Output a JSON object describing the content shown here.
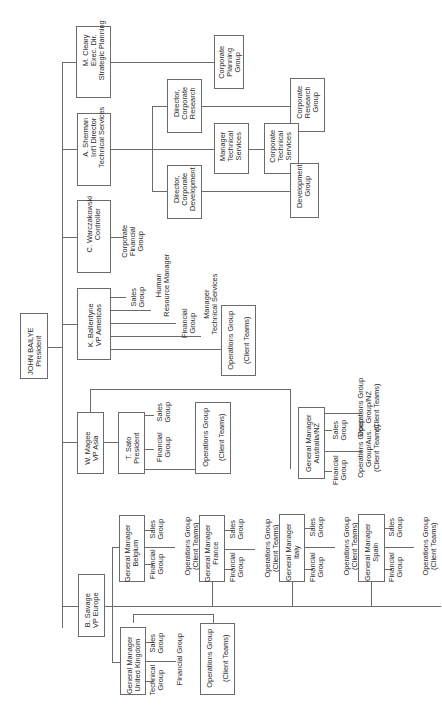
{
  "chart": {
    "president": {
      "name": "JOHN BAILYE",
      "title": "President"
    },
    "executives": [
      {
        "label": "M. Cleary\nExec. Dir.\nStrategic Planning",
        "reports": [
          "Corporate\nPlanning\nGroup"
        ]
      },
      {
        "label": "A. Sherman\nInt'l Director\nTechnical Services",
        "reports": [
          {
            "label": "Director,\nCorporate\nResearch",
            "reports": [
              "Corporate\nResearch\nGroup"
            ]
          },
          {
            "label": "Manager\nTechnical\nServices",
            "reports": [
              "Corporate\nTechnical\nServices"
            ]
          },
          {
            "label": "Director,\nCorporate\nDevelopment",
            "reports": [
              "Development\nGroup"
            ]
          }
        ]
      },
      {
        "label": "C. Warczakowski\nController",
        "reports": [
          "Corporate\nFinancial\nGroup"
        ]
      },
      {
        "label": "K. Ballentyne\nVP Americas",
        "reports": [
          "Sales\nGroup",
          "Human\nResource Manager",
          "Financial\nGroup",
          "Manager\nTechnical Services",
          "Operations Group\n\n(Client Teams)"
        ]
      },
      {
        "label": "W. Magee\nVP Asia",
        "reports": [
          {
            "label": "T. Sato\nPresident",
            "reports": [
              "Sales\nGroup",
              "Financial\nGroup",
              "Operations Group\n\n(Client Teams)"
            ]
          },
          {
            "label": "General Manager\nAustralia/NZ",
            "reports": [
              "Sales\nGroup",
              "Financial\nGroup",
              "Operations Group\nGroup/Aus.\n(Client Teams)",
              "Operations Group\nGroup/NZ\n(Client Teams)"
            ]
          }
        ]
      },
      {
        "label": "B. Savage\nVP Europe",
        "reports": [
          {
            "label": "General Manager\nUnited Kingdom",
            "reports": [
              "Sales\nGroup",
              "Technical\nGroup",
              "Financial Group",
              "Operations Group\n\n(Client Teams)"
            ]
          },
          {
            "label": "General Manager\nBelgium",
            "reports": [
              "Sales\nGroup",
              "Financial\nGroup",
              "Operations Group\n(Client Teams)"
            ]
          },
          {
            "label": "General Manager\nFrance",
            "reports": [
              "Sales\nGroup",
              "Financial\nGroup",
              "Operations Group\n(Client Teams)"
            ]
          },
          {
            "label": "General Manager\nItaly",
            "reports": [
              "Sales\nGroup",
              "Financial\nGroup",
              "Operations Group\n(Client Teams)"
            ]
          },
          {
            "label": "General Manager\nSpain",
            "reports": [
              "Sales\nGroup",
              "Financial\nGroup",
              "Operations Group\n(Client Teams)"
            ]
          }
        ]
      }
    ]
  },
  "labels": {
    "president": "JOHN BAILYE\nPresident",
    "cleary": "M. Cleary\nExec. Dir.\nStrategic Planning",
    "corp_planning": "Corporate\nPlanning\nGroup",
    "sherman": "A. Sherman\nInt'l Director\nTechnical Services",
    "dir_research": "Director,\nCorporate\nResearch",
    "corp_research_group": "Corporate\nResearch\nGroup",
    "mgr_tech": "Manager\nTechnical\nServices",
    "corp_tech": "Corporate\nTechnical\nServices",
    "dir_dev": "Director,\nCorporate\nDevelopment",
    "dev_group": "Development\nGroup",
    "warcz": "C. Warczakowski\nController",
    "corp_fin": "Corporate\nFinancial\nGroup",
    "ballentyne": "K. Ballentyne\nVP Americas",
    "am_sales": "Sales\nGroup",
    "am_hr": "Human\nResource Manager",
    "am_fin": "Financial\nGroup",
    "am_mgr_tech": "Manager\nTechnical Services",
    "am_ops": "Operations Group\n\n(Client Teams)",
    "magee": "W. Magee\nVP Asia",
    "sato": "T. Sato\nPresident",
    "sato_fin": "Financial\nGroup",
    "sato_sales": "Sales\nGroup",
    "sato_ops": "Operations Group\n\n(Client Teams)",
    "aus": "General Manager\nAustralia/NZ",
    "aus_fin": "Financial\nGroup",
    "aus_sales": "Sales\nGroup",
    "aus_ops_aus": "Operations Group\nGroup/Aus.\n(Client Teams)",
    "aus_ops_nz": "Operations Group\nGroup/NZ\n(Client Teams)",
    "savage": "B. Savage\nVP Europe",
    "uk": "General Manager\nUnited Kingdom",
    "uk_tech": "Technical\nGroup",
    "uk_sales": "Sales\nGroup",
    "uk_fin": "Financial Group",
    "uk_ops": "Operations Group\n\n(Client Teams)",
    "be": "General Manager\nBelgium",
    "be_fin": "Financial\nGroup",
    "be_sales": "Sales\nGroup",
    "be_ops": "Operations Group\n(Client Teams)",
    "fr": "General Manager\nFrance",
    "fr_fin": "Financial\nGroup",
    "fr_sales": "Sales\nGroup",
    "fr_ops": "Operations Group\n(Client Teams)",
    "it": "General Manager\nItaly",
    "it_fin": "Financial\nGroup",
    "it_sales": "Sales\nGroup",
    "it_ops": "Operations Group\n(Client Teams)",
    "es": "General Manager\nSpain",
    "es_fin": "Financial\nGroup",
    "es_sales": "Sales\nGroup",
    "es_ops": "Operations Group\n(Client Teams)"
  },
  "colors": {
    "line": "#6b6b6b",
    "text": "#2a2a2a",
    "background": "#ffffff"
  }
}
